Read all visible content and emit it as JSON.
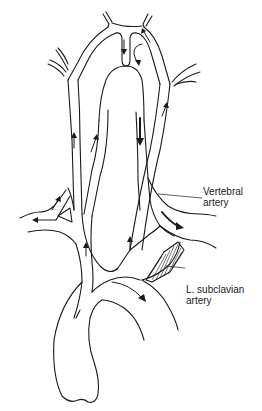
{
  "figure": {
    "labels": {
      "vertebral": {
        "line1": "Vertebral",
        "line2": "artery"
      },
      "subclavian": {
        "line1": "L. subclavian",
        "line2": "artery"
      }
    },
    "colors": {
      "stroke": "#1a1a1a",
      "background": "#ffffff"
    },
    "arrows": [
      {
        "id": "basilar-down",
        "direction": "down"
      },
      {
        "id": "circle-right-down",
        "direction": "down-curved"
      },
      {
        "id": "top-right-up",
        "direction": "up"
      },
      {
        "id": "right-carotid-up",
        "direction": "up"
      },
      {
        "id": "right-vertebral-up",
        "direction": "up"
      },
      {
        "id": "left-vertebral-down-bold",
        "direction": "down"
      },
      {
        "id": "left-carotid-up",
        "direction": "up"
      },
      {
        "id": "right-subclavian-branch-up",
        "direction": "up"
      },
      {
        "id": "right-subclavian-left",
        "direction": "left"
      },
      {
        "id": "left-subclavian-distal-right-bold",
        "direction": "right"
      },
      {
        "id": "innominate-up",
        "direction": "up"
      },
      {
        "id": "left-carotid-origin-up",
        "direction": "up"
      },
      {
        "id": "aorta-descending",
        "direction": "down-right"
      }
    ]
  }
}
